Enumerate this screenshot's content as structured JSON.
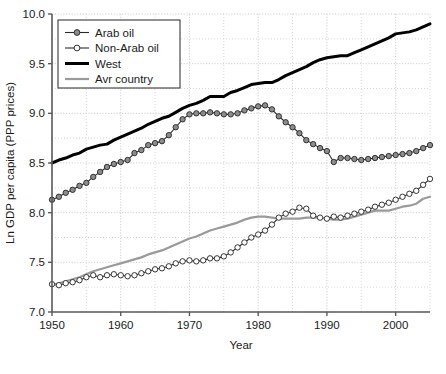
{
  "chart_data": {
    "type": "line",
    "title": "",
    "xlabel": "Year",
    "ylabel": "Ln GDP per capita (PPP prices)",
    "xlim": [
      1950,
      2005
    ],
    "ylim": [
      7.0,
      10.0
    ],
    "grid": true,
    "legend_position": "top-left",
    "xticks": [
      1950,
      1960,
      1970,
      1980,
      1990,
      2000
    ],
    "xtick_labels": [
      "1950",
      "1960",
      "1970",
      "1980",
      "1990",
      "2000"
    ],
    "xminor_step": 5,
    "yticks": [
      7.0,
      7.5,
      8.0,
      8.5,
      9.0,
      9.5,
      10.0
    ],
    "ytick_labels": [
      "7.0",
      "7.5",
      "8.0",
      "8.5",
      "9.0",
      "9.5",
      "10.0"
    ],
    "yminor_step": 0.25,
    "x": [
      1950,
      1951,
      1952,
      1953,
      1954,
      1955,
      1956,
      1957,
      1958,
      1959,
      1960,
      1961,
      1962,
      1963,
      1964,
      1965,
      1966,
      1967,
      1968,
      1969,
      1970,
      1971,
      1972,
      1973,
      1974,
      1975,
      1976,
      1977,
      1978,
      1979,
      1980,
      1981,
      1982,
      1983,
      1984,
      1985,
      1986,
      1987,
      1988,
      1989,
      1990,
      1991,
      1992,
      1993,
      1994,
      1995,
      1996,
      1997,
      1998,
      1999,
      2000,
      2001,
      2002,
      2003,
      2004,
      2005
    ],
    "series": [
      {
        "name": "Arab oil",
        "color": "#2b2b2b",
        "marker": "filled-circle",
        "marker_fill": "#8c8c8c",
        "linewidth": 1.1,
        "values": [
          8.13,
          8.16,
          8.2,
          8.23,
          8.27,
          8.3,
          8.36,
          8.41,
          8.46,
          8.49,
          8.51,
          8.53,
          8.6,
          8.63,
          8.68,
          8.7,
          8.72,
          8.78,
          8.86,
          8.94,
          8.99,
          9.0,
          9.0,
          9.01,
          9.0,
          8.99,
          8.99,
          9.0,
          9.03,
          9.05,
          9.07,
          9.08,
          9.04,
          8.97,
          8.91,
          8.86,
          8.8,
          8.73,
          8.69,
          8.65,
          8.62,
          8.51,
          8.55,
          8.55,
          8.54,
          8.53,
          8.54,
          8.55,
          8.56,
          8.57,
          8.58,
          8.59,
          8.6,
          8.62,
          8.65,
          8.68
        ]
      },
      {
        "name": "Non-Arab oil",
        "color": "#2b2b2b",
        "marker": "open-circle",
        "marker_fill": "#ffffff",
        "linewidth": 1.1,
        "values": [
          7.28,
          7.27,
          7.29,
          7.3,
          7.32,
          7.35,
          7.37,
          7.35,
          7.37,
          7.38,
          7.37,
          7.36,
          7.37,
          7.39,
          7.41,
          7.43,
          7.44,
          7.46,
          7.49,
          7.51,
          7.52,
          7.51,
          7.52,
          7.54,
          7.54,
          7.56,
          7.6,
          7.65,
          7.7,
          7.75,
          7.78,
          7.82,
          7.88,
          7.95,
          7.99,
          8.01,
          8.05,
          8.04,
          7.97,
          7.95,
          7.94,
          7.96,
          7.95,
          7.97,
          7.99,
          8.01,
          8.03,
          8.06,
          8.08,
          8.1,
          8.13,
          8.16,
          8.19,
          8.22,
          8.28,
          8.34
        ]
      },
      {
        "name": "West",
        "color": "#000000",
        "marker": "none",
        "marker_fill": "#000000",
        "linewidth": 3.0,
        "values": [
          8.5,
          8.53,
          8.55,
          8.58,
          8.6,
          8.64,
          8.66,
          8.68,
          8.69,
          8.73,
          8.76,
          8.79,
          8.82,
          8.85,
          8.89,
          8.92,
          8.95,
          8.97,
          9.01,
          9.05,
          9.08,
          9.1,
          9.13,
          9.17,
          9.17,
          9.17,
          9.21,
          9.23,
          9.26,
          9.29,
          9.3,
          9.31,
          9.31,
          9.34,
          9.38,
          9.41,
          9.44,
          9.47,
          9.51,
          9.54,
          9.56,
          9.57,
          9.58,
          9.58,
          9.61,
          9.64,
          9.67,
          9.7,
          9.73,
          9.76,
          9.8,
          9.81,
          9.82,
          9.84,
          9.87,
          9.9
        ]
      },
      {
        "name": "Avr country",
        "color": "#9a9a9a",
        "marker": "none",
        "marker_fill": "#9a9a9a",
        "linewidth": 2.2,
        "values": [
          7.27,
          7.29,
          7.31,
          7.33,
          7.35,
          7.38,
          7.41,
          7.43,
          7.45,
          7.47,
          7.49,
          7.51,
          7.53,
          7.55,
          7.58,
          7.6,
          7.62,
          7.65,
          7.68,
          7.71,
          7.74,
          7.76,
          7.79,
          7.82,
          7.84,
          7.86,
          7.88,
          7.9,
          7.93,
          7.95,
          7.96,
          7.96,
          7.95,
          7.94,
          7.94,
          7.94,
          7.94,
          7.95,
          7.95,
          7.95,
          7.94,
          7.93,
          7.93,
          7.94,
          7.96,
          7.98,
          8.0,
          8.02,
          8.02,
          8.02,
          8.04,
          8.06,
          8.07,
          8.09,
          8.14,
          8.16
        ]
      }
    ]
  },
  "legend": {
    "entries": [
      {
        "label": "Arab oil"
      },
      {
        "label": "Non-Arab oil"
      },
      {
        "label": "West"
      },
      {
        "label": "Avr country"
      }
    ]
  },
  "axes": {
    "x_title": "Year",
    "y_title": "Ln GDP per capita (PPP prices)"
  },
  "colors": {
    "axis": "#5a5a5a",
    "grid": "#c9c9c9",
    "dark_line": "#2b2b2b",
    "west_line": "#000000",
    "avr_line": "#9a9a9a",
    "marker_fill_arab": "#8c8c8c",
    "marker_fill_nonarab": "#ffffff",
    "background": "#ffffff",
    "text": "#1a1a1a"
  }
}
